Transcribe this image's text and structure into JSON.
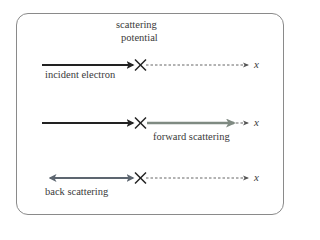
{
  "title_label": {
    "line1": "scattering",
    "line2": "potential"
  },
  "rows": [
    {
      "name": "incident",
      "label": "incident electron",
      "axis_label": "x"
    },
    {
      "name": "forward",
      "label": "forward scattering",
      "axis_label": "x"
    },
    {
      "name": "back",
      "label": "back scattering",
      "axis_label": "x"
    }
  ],
  "colors": {
    "incident_arrow": "#222222",
    "forward_arrow": "#7f8a82",
    "back_arrow": "#5d6670",
    "dashed_axis": "#555555",
    "frame": "#8a8a8a"
  }
}
